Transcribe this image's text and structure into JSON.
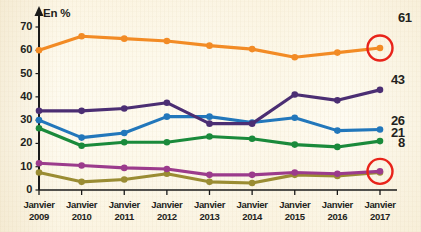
{
  "axis_unit_label": "En %",
  "chart_data": {
    "type": "line",
    "title": "",
    "subtitle": "",
    "xlabel": "",
    "ylabel": "En %",
    "ylim": [
      0,
      70
    ],
    "yticks": [
      0,
      10,
      20,
      30,
      40,
      50,
      60,
      70
    ],
    "grid": false,
    "legend_position": "none",
    "categories": [
      "Janvier 2009",
      "Janvier 2010",
      "Janvier 2011",
      "Janvier 2012",
      "Janvier 2013",
      "Janvier 2014",
      "Janvier 2015",
      "Janvier 2016",
      "Janvier 2017"
    ],
    "x_tick_lines": [
      {
        "top": "Janvier",
        "bottom": "2009"
      },
      {
        "top": "Janvier",
        "bottom": "2010"
      },
      {
        "top": "Janvier",
        "bottom": "2011"
      },
      {
        "top": "Janvier",
        "bottom": "2012"
      },
      {
        "top": "Janvier",
        "bottom": "2013"
      },
      {
        "top": "Janvier",
        "bottom": "2014"
      },
      {
        "top": "Janvier",
        "bottom": "2015"
      },
      {
        "top": "Janvier",
        "bottom": "2016"
      },
      {
        "top": "Janvier",
        "bottom": "2017"
      }
    ],
    "series": [
      {
        "name": "orange-series",
        "color": "#F28B25",
        "values": [
          60,
          66,
          65,
          64,
          62,
          60.5,
          57,
          59,
          61
        ],
        "end_label": "61",
        "highlighted": true
      },
      {
        "name": "purple-series",
        "color": "#4B2E73",
        "values": [
          34,
          34,
          35,
          37.5,
          28.5,
          28.5,
          41,
          38.5,
          43
        ],
        "end_label": "43",
        "highlighted": false
      },
      {
        "name": "blue-series",
        "color": "#2277BB",
        "values": [
          30,
          22.5,
          24.5,
          31.5,
          31.5,
          29,
          31,
          25.5,
          26
        ],
        "end_label": "26",
        "highlighted": false
      },
      {
        "name": "green-series",
        "color": "#1A8A3B",
        "values": [
          26.5,
          19,
          20.5,
          20.5,
          23,
          22,
          19.5,
          18.5,
          21
        ],
        "end_label": "21",
        "highlighted": false
      },
      {
        "name": "magenta-series",
        "color": "#9B3B8C",
        "values": [
          11.5,
          10.5,
          9.5,
          9,
          6.5,
          6.5,
          7.5,
          7,
          8
        ],
        "end_label": "8",
        "highlighted": true
      },
      {
        "name": "olive-series",
        "color": "#9A8C33",
        "values": [
          7.5,
          3.5,
          4.5,
          7,
          3.5,
          3,
          6.5,
          6,
          7.5
        ],
        "end_label": "",
        "highlighted": false
      }
    ],
    "highlight_circle_color": "#E8231A",
    "annotations": [
      {
        "label": "61",
        "series": "orange-series",
        "category": "Janvier 2017",
        "circled": true
      },
      {
        "label": "43",
        "series": "purple-series",
        "category": "Janvier 2017",
        "circled": false
      },
      {
        "label": "26",
        "series": "blue-series",
        "category": "Janvier 2017",
        "circled": false
      },
      {
        "label": "21",
        "series": "green-series",
        "category": "Janvier 2017",
        "circled": false
      },
      {
        "label": "8",
        "series": "magenta-series",
        "category": "Janvier 2017",
        "circled": true
      }
    ]
  }
}
